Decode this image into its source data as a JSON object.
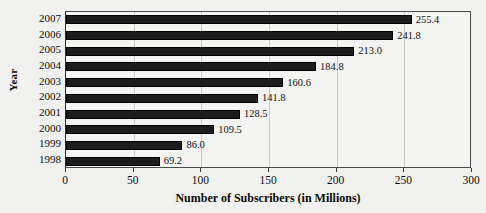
{
  "chart_data": {
    "type": "bar",
    "orientation": "horizontal",
    "title": "",
    "xlabel": "Number of Subscribers (in Millions)",
    "ylabel": "Year",
    "categories": [
      "2007",
      "2006",
      "2005",
      "2004",
      "2003",
      "2002",
      "2001",
      "2000",
      "1999",
      "1998"
    ],
    "values": [
      255.4,
      241.8,
      213.0,
      184.8,
      160.6,
      141.8,
      128.5,
      109.5,
      86.0,
      69.2
    ],
    "data_labels": [
      "255.4",
      "241.8",
      "213.0",
      "184.8",
      "160.6",
      "141.8",
      "128.5",
      "109.5",
      "86.0",
      "69.2"
    ],
    "xlim": [
      0,
      300
    ],
    "xticks": [
      0,
      50,
      100,
      150,
      200,
      250,
      300
    ],
    "xtick_labels": [
      "0",
      "50",
      "100",
      "150",
      "200",
      "250",
      "300"
    ],
    "grid": true,
    "grid_axis": "x",
    "legend": false,
    "bar_color": "#1c1c1c",
    "grid_color": "#c9c9c6",
    "background_color": "#f1f1ef",
    "axis_color": "#3a3a3a"
  }
}
